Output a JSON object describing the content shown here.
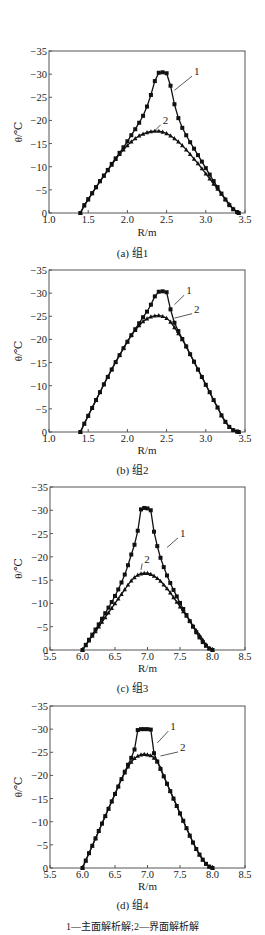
{
  "figure": {
    "footnote": "1—主面解析解;2—界面解析解",
    "y_label": "θ/℃",
    "x_label": "R/m",
    "line_color": "#111111",
    "frame_color": "#555555"
  },
  "chart_data": [
    {
      "type": "line",
      "title": "(a) 组1",
      "xlabel": "R/m",
      "ylabel": "θ/℃",
      "xlim": [
        1.0,
        3.5
      ],
      "ylim": [
        0,
        -35
      ],
      "xticks": [
        1.0,
        1.5,
        2.0,
        2.5,
        3.0,
        3.5
      ],
      "xtick_labels": [
        "1.0",
        "1.5",
        "2.0",
        "2.5",
        "3.0",
        "3.5"
      ],
      "yticks": [
        0,
        -5,
        -10,
        -15,
        -20,
        -25,
        -30,
        -35
      ],
      "ytick_labels": [
        "0",
        "−5",
        "−10",
        "−15",
        "−20",
        "−25",
        "−30",
        "−35"
      ],
      "grid": false,
      "frame": {
        "left": 49,
        "right": 245,
        "top": 51,
        "bottom": 213
      },
      "label_y": 233,
      "caption_y": 253,
      "series": [
        {
          "name": "1",
          "label": "1",
          "marker": "square",
          "label_pos": [
            2.85,
            -30.0
          ],
          "leader_to": [
            2.6,
            -26.5
          ],
          "x": [
            1.4,
            1.45,
            1.5,
            1.55,
            1.6,
            1.65,
            1.7,
            1.75,
            1.8,
            1.85,
            1.9,
            1.95,
            2.0,
            2.05,
            2.1,
            2.15,
            2.2,
            2.25,
            2.3,
            2.35,
            2.4,
            2.45,
            2.5,
            2.55,
            2.6,
            2.65,
            2.7,
            2.75,
            2.8,
            2.85,
            2.9,
            2.95,
            3.0,
            3.05,
            3.1,
            3.15,
            3.2,
            3.25,
            3.3,
            3.35,
            3.4,
            3.42
          ],
          "y": [
            0,
            -1.7,
            -3.0,
            -4.3,
            -5.6,
            -6.9,
            -8.1,
            -9.3,
            -10.6,
            -11.8,
            -13.0,
            -14.2,
            -15.5,
            -16.8,
            -18.1,
            -19.5,
            -21.0,
            -23.0,
            -25.5,
            -28.5,
            -30.3,
            -30.4,
            -30.2,
            -27.5,
            -23.5,
            -20.5,
            -18.4,
            -16.8,
            -15.3,
            -13.9,
            -12.5,
            -11.1,
            -9.7,
            -8.3,
            -6.9,
            -5.6,
            -4.2,
            -2.9,
            -1.7,
            -0.8,
            -0.2,
            0
          ]
        },
        {
          "name": "2",
          "label": "2",
          "marker": "triangle",
          "label_pos": [
            2.45,
            -19.5
          ],
          "leader_to": [
            2.35,
            -17.8
          ],
          "x": [
            1.4,
            1.45,
            1.5,
            1.55,
            1.6,
            1.65,
            1.7,
            1.75,
            1.8,
            1.85,
            1.9,
            1.95,
            2.0,
            2.05,
            2.1,
            2.15,
            2.2,
            2.25,
            2.3,
            2.35,
            2.4,
            2.45,
            2.5,
            2.55,
            2.6,
            2.65,
            2.7,
            2.75,
            2.8,
            2.85,
            2.9,
            2.95,
            3.0,
            3.05,
            3.1,
            3.15,
            3.2,
            3.25,
            3.3,
            3.35,
            3.4,
            3.42
          ],
          "y": [
            0,
            -1.6,
            -2.9,
            -4.2,
            -5.5,
            -6.8,
            -8.0,
            -9.2,
            -10.4,
            -11.6,
            -12.7,
            -13.7,
            -14.6,
            -15.4,
            -16.1,
            -16.7,
            -17.1,
            -17.4,
            -17.6,
            -17.7,
            -17.7,
            -17.5,
            -17.2,
            -16.7,
            -16.1,
            -15.4,
            -14.6,
            -13.7,
            -12.7,
            -11.7,
            -10.7,
            -9.6,
            -8.5,
            -7.4,
            -6.3,
            -5.2,
            -4.1,
            -3.0,
            -1.9,
            -0.9,
            -0.2,
            0
          ]
        }
      ]
    },
    {
      "type": "line",
      "title": "(b) 组2",
      "xlabel": "R/m",
      "ylabel": "θ/℃",
      "xlim": [
        1.0,
        3.5
      ],
      "ylim": [
        0,
        -35
      ],
      "xticks": [
        1.0,
        1.5,
        2.0,
        2.5,
        3.0,
        3.5
      ],
      "xtick_labels": [
        "1.0",
        "1.5",
        "2.0",
        "2.5",
        "3.0",
        "3.5"
      ],
      "yticks": [
        0,
        -5,
        -10,
        -15,
        -20,
        -25,
        -30,
        -35
      ],
      "ytick_labels": [
        "0",
        "−5",
        "−10",
        "−15",
        "−20",
        "−25",
        "−30",
        "−35"
      ],
      "grid": false,
      "frame": {
        "left": 49,
        "right": 245,
        "top": 270,
        "bottom": 432
      },
      "label_y": 451,
      "caption_y": 470,
      "series": [
        {
          "name": "1",
          "label": "1",
          "marker": "square",
          "label_pos": [
            2.75,
            -30.0
          ],
          "leader_to": [
            2.6,
            -27.5
          ],
          "x": [
            1.4,
            1.45,
            1.5,
            1.55,
            1.6,
            1.65,
            1.7,
            1.75,
            1.8,
            1.85,
            1.9,
            1.95,
            2.0,
            2.05,
            2.1,
            2.15,
            2.2,
            2.25,
            2.3,
            2.35,
            2.4,
            2.45,
            2.5,
            2.55,
            2.6,
            2.65,
            2.7,
            2.75,
            2.8,
            2.85,
            2.9,
            2.95,
            3.0,
            3.05,
            3.1,
            3.15,
            3.2,
            3.25,
            3.3,
            3.35,
            3.4,
            3.42
          ],
          "y": [
            0,
            -1.8,
            -3.5,
            -5.2,
            -6.9,
            -8.6,
            -10.3,
            -11.9,
            -13.5,
            -15.1,
            -16.6,
            -18.1,
            -19.5,
            -20.9,
            -22.2,
            -23.5,
            -24.8,
            -26.0,
            -27.5,
            -29.3,
            -30.3,
            -30.4,
            -30.2,
            -26.5,
            -23.6,
            -21.8,
            -20.1,
            -18.5,
            -16.8,
            -15.2,
            -13.5,
            -11.9,
            -10.2,
            -8.6,
            -6.9,
            -5.3,
            -3.6,
            -2.2,
            -1.1,
            -0.4,
            -0.1,
            0
          ]
        },
        {
          "name": "2",
          "label": "2",
          "marker": "triangle",
          "label_pos": [
            2.85,
            -26.0
          ],
          "leader_to": [
            2.6,
            -24.6
          ],
          "x": [
            1.4,
            1.45,
            1.5,
            1.55,
            1.6,
            1.65,
            1.7,
            1.75,
            1.8,
            1.85,
            1.9,
            1.95,
            2.0,
            2.05,
            2.1,
            2.15,
            2.2,
            2.25,
            2.3,
            2.35,
            2.4,
            2.45,
            2.5,
            2.55,
            2.6,
            2.65,
            2.7,
            2.75,
            2.8,
            2.85,
            2.9,
            2.95,
            3.0,
            3.05,
            3.1,
            3.15,
            3.2,
            3.25,
            3.3,
            3.35,
            3.4,
            3.42
          ],
          "y": [
            0,
            -1.8,
            -3.5,
            -5.2,
            -6.9,
            -8.6,
            -10.3,
            -11.9,
            -13.5,
            -15.1,
            -16.6,
            -18.1,
            -19.5,
            -20.9,
            -22.0,
            -23.0,
            -23.9,
            -24.5,
            -24.9,
            -25.1,
            -25.2,
            -25.0,
            -24.6,
            -23.8,
            -22.6,
            -21.3,
            -20.0,
            -18.5,
            -16.8,
            -15.2,
            -13.5,
            -11.9,
            -10.2,
            -8.6,
            -6.9,
            -5.3,
            -3.6,
            -2.2,
            -1.1,
            -0.4,
            -0.1,
            0
          ]
        }
      ]
    },
    {
      "type": "line",
      "title": "(c) 组3",
      "xlabel": "R/m",
      "ylabel": "θ/℃",
      "xlim": [
        5.5,
        8.5
      ],
      "ylim": [
        0,
        -35
      ],
      "xticks": [
        5.5,
        6.0,
        6.5,
        7.0,
        7.5,
        8.0,
        8.5
      ],
      "xtick_labels": [
        "5.5",
        "6.0",
        "6.5",
        "7.0",
        "7.5",
        "8.0",
        "8.5"
      ],
      "yticks": [
        0,
        -5,
        -10,
        -15,
        -20,
        -25,
        -30,
        -35
      ],
      "ytick_labels": [
        "0",
        "−5",
        "−10",
        "−15",
        "−20",
        "−25",
        "−30",
        "−35"
      ],
      "grid": false,
      "frame": {
        "left": 50,
        "right": 245,
        "top": 487,
        "bottom": 650
      },
      "label_y": 669,
      "caption_y": 688,
      "series": [
        {
          "name": "1",
          "label": "1",
          "marker": "square",
          "label_pos": [
            7.5,
            -24.5
          ],
          "leader_to": [
            7.3,
            -22.0
          ],
          "x": [
            6.0,
            6.05,
            6.1,
            6.15,
            6.2,
            6.25,
            6.3,
            6.35,
            6.4,
            6.45,
            6.5,
            6.55,
            6.6,
            6.65,
            6.7,
            6.75,
            6.8,
            6.85,
            6.9,
            6.95,
            7.0,
            7.05,
            7.1,
            7.15,
            7.2,
            7.25,
            7.3,
            7.35,
            7.4,
            7.45,
            7.5,
            7.55,
            7.6,
            7.65,
            7.7,
            7.75,
            7.8,
            7.85,
            7.9,
            7.95,
            8.0
          ],
          "y": [
            0,
            -1.1,
            -2.2,
            -3.3,
            -4.4,
            -5.5,
            -6.7,
            -7.9,
            -9.1,
            -10.3,
            -11.6,
            -13.0,
            -14.5,
            -16.2,
            -18.2,
            -20.5,
            -22.6,
            -25.6,
            -30.2,
            -30.5,
            -30.4,
            -30.0,
            -25.4,
            -22.3,
            -19.8,
            -17.8,
            -16.0,
            -14.4,
            -12.9,
            -11.5,
            -10.1,
            -8.8,
            -7.5,
            -6.2,
            -5.0,
            -3.8,
            -2.7,
            -1.7,
            -0.9,
            -0.3,
            0
          ]
        },
        {
          "name": "2",
          "label": "2",
          "marker": "triangle",
          "label_pos": [
            6.95,
            -19.0
          ],
          "leader_to": [
            6.9,
            -17.2
          ],
          "x": [
            6.0,
            6.05,
            6.1,
            6.15,
            6.2,
            6.25,
            6.3,
            6.35,
            6.4,
            6.45,
            6.5,
            6.55,
            6.6,
            6.65,
            6.7,
            6.75,
            6.8,
            6.85,
            6.9,
            6.95,
            7.0,
            7.05,
            7.1,
            7.15,
            7.2,
            7.25,
            7.3,
            7.35,
            7.4,
            7.45,
            7.5,
            7.55,
            7.6,
            7.65,
            7.7,
            7.75,
            7.8,
            7.85,
            7.9,
            7.95,
            8.0
          ],
          "y": [
            0,
            -1.0,
            -2.0,
            -3.0,
            -4.0,
            -5.0,
            -6.0,
            -7.0,
            -8.0,
            -9.0,
            -10.0,
            -11.0,
            -12.0,
            -13.0,
            -14.0,
            -14.9,
            -15.6,
            -16.1,
            -16.4,
            -16.5,
            -16.5,
            -16.3,
            -15.9,
            -15.4,
            -14.8,
            -14.0,
            -13.2,
            -12.3,
            -11.3,
            -10.3,
            -9.3,
            -8.3,
            -7.3,
            -6.3,
            -5.2,
            -4.2,
            -3.2,
            -2.2,
            -1.2,
            -0.4,
            0
          ]
        }
      ]
    },
    {
      "type": "line",
      "title": "(d) 组4",
      "xlabel": "R/m",
      "ylabel": "θ/℃",
      "xlim": [
        5.5,
        8.5
      ],
      "ylim": [
        0,
        -35
      ],
      "xticks": [
        5.5,
        6.0,
        6.5,
        7.0,
        7.5,
        8.0,
        8.5
      ],
      "xtick_labels": [
        "5.5",
        "6.0",
        "6.5",
        "7.0",
        "7.5",
        "8.0",
        "8.5"
      ],
      "yticks": [
        0,
        -5,
        -10,
        -15,
        -20,
        -25,
        -30,
        -35
      ],
      "ytick_labels": [
        "0",
        "−5",
        "−10",
        "−15",
        "−20",
        "−25",
        "−30",
        "−35"
      ],
      "grid": false,
      "frame": {
        "left": 50,
        "right": 245,
        "top": 706,
        "bottom": 868
      },
      "label_y": 887,
      "caption_y": 905,
      "series": [
        {
          "name": "1",
          "label": "1",
          "marker": "square",
          "label_pos": [
            7.35,
            -30.0
          ],
          "leader_to": [
            7.15,
            -27.0
          ],
          "x": [
            6.0,
            6.05,
            6.1,
            6.15,
            6.2,
            6.25,
            6.3,
            6.35,
            6.4,
            6.45,
            6.5,
            6.55,
            6.6,
            6.65,
            6.7,
            6.75,
            6.8,
            6.85,
            6.9,
            6.95,
            7.0,
            7.05,
            7.1,
            7.15,
            7.2,
            7.25,
            7.3,
            7.35,
            7.4,
            7.45,
            7.5,
            7.55,
            7.6,
            7.65,
            7.7,
            7.75,
            7.8,
            7.85,
            7.9,
            7.95,
            8.0
          ],
          "y": [
            0,
            -1.6,
            -3.2,
            -4.8,
            -6.4,
            -8.0,
            -9.6,
            -11.2,
            -12.8,
            -14.4,
            -16.0,
            -17.6,
            -19.2,
            -20.8,
            -22.3,
            -23.8,
            -25.6,
            -29.8,
            -30.0,
            -30.0,
            -30.0,
            -29.9,
            -24.8,
            -23.0,
            -21.4,
            -19.8,
            -18.2,
            -16.6,
            -15.0,
            -13.4,
            -11.8,
            -10.2,
            -8.6,
            -7.0,
            -5.5,
            -4.1,
            -2.9,
            -1.8,
            -0.9,
            -0.3,
            0
          ]
        },
        {
          "name": "2",
          "label": "2",
          "marker": "triangle",
          "label_pos": [
            7.5,
            -25.5
          ],
          "leader_to": [
            7.2,
            -24.2
          ],
          "x": [
            6.0,
            6.05,
            6.1,
            6.15,
            6.2,
            6.25,
            6.3,
            6.35,
            6.4,
            6.45,
            6.5,
            6.55,
            6.6,
            6.65,
            6.7,
            6.75,
            6.8,
            6.85,
            6.9,
            6.95,
            7.0,
            7.05,
            7.1,
            7.15,
            7.2,
            7.25,
            7.3,
            7.35,
            7.4,
            7.45,
            7.5,
            7.55,
            7.6,
            7.65,
            7.7,
            7.75,
            7.8,
            7.85,
            7.9,
            7.95,
            8.0
          ],
          "y": [
            0,
            -1.6,
            -3.2,
            -4.8,
            -6.4,
            -8.0,
            -9.6,
            -11.2,
            -12.8,
            -14.4,
            -16.0,
            -17.6,
            -19.2,
            -20.6,
            -21.9,
            -22.9,
            -23.7,
            -24.2,
            -24.5,
            -24.6,
            -24.5,
            -24.3,
            -23.8,
            -23.0,
            -21.6,
            -19.9,
            -18.2,
            -16.6,
            -15.0,
            -13.4,
            -11.8,
            -10.2,
            -8.6,
            -7.0,
            -5.5,
            -4.1,
            -2.9,
            -1.8,
            -0.9,
            -0.3,
            0
          ]
        }
      ]
    }
  ]
}
